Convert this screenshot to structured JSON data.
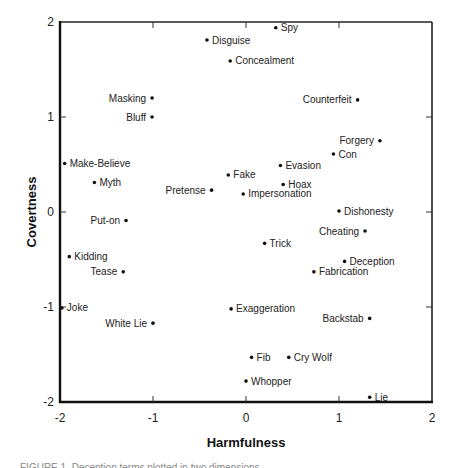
{
  "chart_data": {
    "type": "scatter",
    "title": "",
    "xlabel": "Harmfulness",
    "ylabel": "Covertness",
    "xlim": [
      -2,
      2
    ],
    "ylim": [
      -2,
      2
    ],
    "xticks": [
      -2,
      -1,
      0,
      1,
      2
    ],
    "yticks": [
      -2,
      -1,
      0,
      1,
      2
    ],
    "xtick_labels": [
      "-2",
      "-1",
      "0",
      "1",
      "2"
    ],
    "ytick_labels": [
      "-2",
      "-1",
      "0",
      "1",
      "2"
    ],
    "grid": false,
    "legend": null,
    "points": [
      {
        "label": "Spy",
        "x": 0.32,
        "y": 1.94,
        "side": "right"
      },
      {
        "label": "Disguise",
        "x": -0.42,
        "y": 1.81,
        "side": "right"
      },
      {
        "label": "Concealment",
        "x": -0.17,
        "y": 1.59,
        "side": "right"
      },
      {
        "label": "Masking",
        "x": -1.01,
        "y": 1.2,
        "side": "left"
      },
      {
        "label": "Bluff",
        "x": -1.01,
        "y": 1.0,
        "side": "left"
      },
      {
        "label": "Counterfeit",
        "x": 1.2,
        "y": 1.18,
        "side": "left"
      },
      {
        "label": "Forgery",
        "x": 1.44,
        "y": 0.75,
        "side": "left"
      },
      {
        "label": "Con",
        "x": 0.94,
        "y": 0.61,
        "side": "right"
      },
      {
        "label": "Make-Believe",
        "x": -1.95,
        "y": 0.51,
        "side": "right"
      },
      {
        "label": "Evasion",
        "x": 0.37,
        "y": 0.49,
        "side": "right"
      },
      {
        "label": "Myth",
        "x": -1.63,
        "y": 0.31,
        "side": "right"
      },
      {
        "label": "Fake",
        "x": -0.19,
        "y": 0.39,
        "side": "right"
      },
      {
        "label": "Hoax",
        "x": 0.4,
        "y": 0.29,
        "side": "right"
      },
      {
        "label": "Pretense",
        "x": -0.37,
        "y": 0.23,
        "side": "left"
      },
      {
        "label": "Impersonation",
        "x": -0.03,
        "y": 0.19,
        "side": "right"
      },
      {
        "label": "Dishonesty",
        "x": 1.0,
        "y": 0.01,
        "side": "right"
      },
      {
        "label": "Put-on",
        "x": -1.29,
        "y": -0.09,
        "side": "left"
      },
      {
        "label": "Cheating",
        "x": 1.28,
        "y": -0.2,
        "side": "left"
      },
      {
        "label": "Trick",
        "x": 0.2,
        "y": -0.33,
        "side": "right"
      },
      {
        "label": "Kidding",
        "x": -1.9,
        "y": -0.47,
        "side": "right"
      },
      {
        "label": "Deception",
        "x": 1.06,
        "y": -0.52,
        "side": "right"
      },
      {
        "label": "Tease",
        "x": -1.32,
        "y": -0.63,
        "side": "left"
      },
      {
        "label": "Fabrication",
        "x": 0.73,
        "y": -0.63,
        "side": "right"
      },
      {
        "label": "Joke",
        "x": -1.98,
        "y": -1.01,
        "side": "right"
      },
      {
        "label": "Exaggeration",
        "x": -0.16,
        "y": -1.02,
        "side": "right"
      },
      {
        "label": "White Lie",
        "x": -1.0,
        "y": -1.17,
        "side": "left"
      },
      {
        "label": "Backstab",
        "x": 1.33,
        "y": -1.12,
        "side": "left"
      },
      {
        "label": "Fib",
        "x": 0.06,
        "y": -1.53,
        "side": "right"
      },
      {
        "label": "Cry Wolf",
        "x": 0.46,
        "y": -1.53,
        "side": "right"
      },
      {
        "label": "Whopper",
        "x": 0.0,
        "y": -1.78,
        "side": "right"
      },
      {
        "label": "Lie",
        "x": 1.33,
        "y": -1.95,
        "side": "right"
      }
    ]
  },
  "caption": "FIGURE 1.  Deception terms plotted in two dimensions"
}
